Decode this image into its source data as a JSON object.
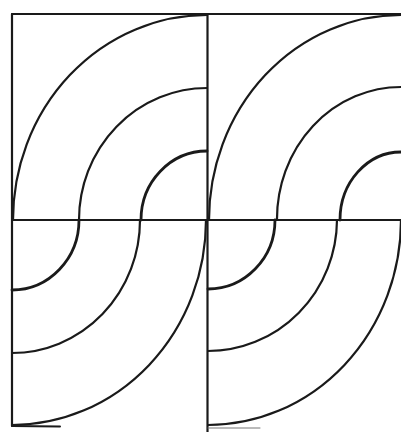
{
  "figure": {
    "stroke_color": "#1a1a1a",
    "background_color": "#ffffff",
    "tiles": [
      {
        "name": "left-tile",
        "left": 12,
        "right": 207,
        "top": 14,
        "midline": 220,
        "bottom": 425,
        "top_quadrant_arc_center": [
          207,
          220
        ],
        "bottom_quadrant_arc_center": [
          12,
          220
        ]
      },
      {
        "name": "right-tile",
        "left": 208,
        "right": 401,
        "top": 14,
        "midline": 220,
        "bottom": 425,
        "top_quadrant_arc_center": [
          401,
          220
        ],
        "bottom_quadrant_arc_center": [
          208,
          220
        ]
      }
    ],
    "arc_radii": {
      "horizontal": [
        194,
        128,
        65
      ],
      "vertical": [
        205,
        132,
        69
      ]
    }
  }
}
